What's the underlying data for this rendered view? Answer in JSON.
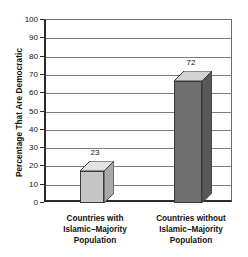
{
  "chart_data": {
    "type": "bar",
    "title": "",
    "subtitle": "",
    "xlabel": "",
    "ylabel": "Percentage That Are Democratic",
    "categories": [
      "Countries with\nIslamic–Majority\nPopulation",
      "Countries without\nIslamic–Majority\nPopulation"
    ],
    "category_lines": [
      [
        "Countries with",
        "Islamic–Majority",
        "Population"
      ],
      [
        "Countries without",
        "Islamic–Majority",
        "Population"
      ]
    ],
    "values": [
      23,
      72
    ],
    "value_labels": [
      "23",
      "72"
    ],
    "ylim": [
      0,
      100
    ],
    "ytick_step": 10,
    "ytick_labels": [
      "100",
      "90",
      "80",
      "70",
      "60",
      "50",
      "40",
      "30",
      "20",
      "10",
      "0"
    ],
    "ytick_values": [
      100,
      90,
      80,
      70,
      60,
      50,
      40,
      30,
      20,
      10,
      0
    ],
    "grid": true,
    "grid_axis": "y",
    "legend": false,
    "legend_position": "none",
    "style": "3d-column",
    "bar_colors": [
      "#c6c6c6",
      "#6e6e6e"
    ],
    "bar_top_colors": [
      "#e3e3e3",
      "#d2d2d2"
    ],
    "bar_side_colors": [
      "#a8a8a8",
      "#585858"
    ],
    "bar_outline_color": "#3a3a3a",
    "grid_color": "#7d7d7d",
    "axis_color": "#2b2b2b",
    "background_color": "#ffffff",
    "text_color": "#111111"
  }
}
